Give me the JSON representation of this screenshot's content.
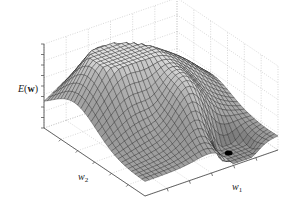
{
  "chart_data": {
    "type": "surface",
    "title": "",
    "zlabel": "E(w)",
    "xlabel": "w1",
    "ylabel": "w2",
    "zlabel_parts": {
      "func": "E",
      "arg": "w"
    },
    "xlabel_parts": {
      "sym": "w",
      "sub": "1"
    },
    "ylabel_parts": {
      "sym": "w",
      "sub": "2"
    },
    "grid": true,
    "legend": null,
    "tick_labels": "none",
    "surface": {
      "grid_size": 30,
      "colormap": "gray",
      "mesh_color": "#1a1a1a",
      "bumps": [
        {
          "u": 0.3,
          "v": 0.3,
          "amp": 1.0,
          "sx": 0.22,
          "sy": 0.22
        },
        {
          "u": 0.75,
          "v": 0.35,
          "amp": 0.45,
          "sx": 0.2,
          "sy": 0.18
        },
        {
          "u": 0.55,
          "v": 0.7,
          "amp": 0.55,
          "sx": 0.14,
          "sy": 0.16
        },
        {
          "u": 0.72,
          "v": 0.88,
          "amp": -0.55,
          "sx": 0.1,
          "sy": 0.1
        },
        {
          "u": 0.4,
          "v": 0.58,
          "amp": -0.2,
          "sx": 0.1,
          "sy": 0.14
        }
      ],
      "base": 0.18
    },
    "minimum_marker": {
      "u": 0.72,
      "v": 0.88,
      "color": "#000000"
    }
  },
  "axes_box": {
    "origin_z_bottom": [
      44,
      128
    ],
    "z_top": [
      44,
      44
    ],
    "front_corner": [
      145,
      196
    ],
    "right_corner": [
      278,
      150
    ],
    "back_top_left": [
      175,
      12
    ],
    "back_top_right": [
      278,
      55
    ],
    "grid_color": "#bdbdbd",
    "axis_color": "#555555"
  },
  "labels": {
    "z": {
      "x": 18,
      "y": 84
    },
    "w2": {
      "x": 78,
      "y": 172
    },
    "w1": {
      "x": 232,
      "y": 182
    }
  }
}
